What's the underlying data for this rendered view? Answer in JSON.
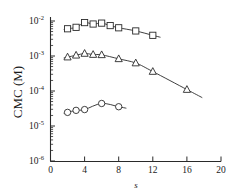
{
  "chart_data": {
    "type": "line",
    "title": "",
    "xlabel": "s",
    "ylabel": "CMC (M)",
    "xlim": [
      0,
      20
    ],
    "ylim": [
      1e-06,
      0.01
    ],
    "yscale": "log",
    "grid": false,
    "legend": "none",
    "xticks": [
      0,
      4,
      8,
      12,
      16,
      20
    ],
    "xtick_labels": [
      "0",
      "4",
      "8",
      "12",
      "16",
      "20"
    ],
    "yticks": [
      0.01,
      0.001,
      0.0001,
      1e-05,
      1e-06
    ],
    "ytick_labels": [
      "10-2",
      "10-3",
      "10-4",
      "10-5",
      "10-6"
    ],
    "ytick_mantissa": [
      "10",
      "10",
      "10",
      "10",
      "10"
    ],
    "ytick_exponent": [
      "-2",
      "-3",
      "-4",
      "-5",
      "-6"
    ],
    "series": [
      {
        "name": "squares",
        "marker": "square",
        "x": [
          2,
          3,
          4,
          5,
          6,
          7,
          8,
          10,
          12
        ],
        "y": [
          0.006,
          0.0066,
          0.009,
          0.0082,
          0.0087,
          0.0074,
          0.0064,
          0.0052,
          0.0039
        ]
      },
      {
        "name": "triangles",
        "marker": "triangle",
        "x": [
          2,
          3,
          4,
          5,
          6,
          8,
          10,
          12,
          16
        ],
        "y": [
          0.00093,
          0.00105,
          0.00118,
          0.0011,
          0.00108,
          0.00083,
          0.00063,
          0.00036,
          0.00011
        ]
      },
      {
        "name": "circles",
        "marker": "circle",
        "x": [
          2,
          3,
          4,
          6,
          8
        ],
        "y": [
          2.45e-05,
          2.8e-05,
          2.95e-05,
          4.4e-05,
          3.55e-05
        ]
      }
    ]
  },
  "figure": {
    "axis_color": "#2a2a2a",
    "background": "#ffffff",
    "ylabel_text": "CMC (M)",
    "xlabel_text": "s"
  }
}
